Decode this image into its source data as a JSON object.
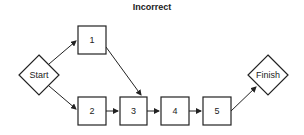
{
  "title": "Incorrect",
  "nodes": {
    "start": "Start",
    "n1": "1",
    "n2": "2",
    "n3": "3",
    "n4": "4",
    "n5": "5",
    "finish": "Finish"
  },
  "edges": [
    [
      "Start",
      "1"
    ],
    [
      "Start",
      "2"
    ],
    [
      "1",
      "3"
    ],
    [
      "2",
      "3"
    ],
    [
      "3",
      "4"
    ],
    [
      "4",
      "5"
    ],
    [
      "5",
      "Finish"
    ]
  ],
  "colors": {
    "stroke": "#222222",
    "background": "#ffffff"
  }
}
